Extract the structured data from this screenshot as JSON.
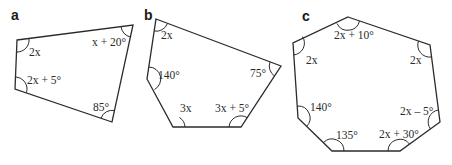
{
  "figures": [
    {
      "label": "a",
      "shape": "quadrilateral",
      "angles": [
        "2x",
        "x + 20°",
        "85°",
        "2x + 5°"
      ]
    },
    {
      "label": "b",
      "shape": "pentagon",
      "angles": [
        "2x",
        "75°",
        "3x + 5°",
        "3x",
        "140°"
      ]
    },
    {
      "label": "c",
      "shape": "heptagon",
      "angles": [
        "2x + 10°",
        "2x",
        "2x – 5°",
        "2x + 30°",
        "135°",
        "140°",
        "2x"
      ]
    }
  ]
}
